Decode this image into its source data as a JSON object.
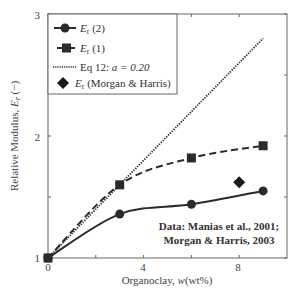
{
  "chart_data": {
    "type": "line",
    "title": "",
    "xlabel": "Organoclay, w(wt%)",
    "ylabel": "Relative Modulus, Er (−)",
    "xlim": [
      0,
      10
    ],
    "ylim": [
      1,
      3
    ],
    "xticks": [
      0,
      2,
      4,
      6,
      8
    ],
    "xtick_labels": [
      "0",
      "",
      "4",
      "",
      "8"
    ],
    "yticks": [
      1,
      1.5,
      2,
      2.5,
      3
    ],
    "ytick_labels": [
      "1",
      "",
      "2",
      "",
      "3"
    ],
    "grid": false,
    "legend_position": "upper left",
    "series": [
      {
        "name": "Er (2)",
        "marker": "circle",
        "line": "solid",
        "x": [
          0,
          3,
          6,
          9
        ],
        "values": [
          1.0,
          1.36,
          1.44,
          1.55
        ]
      },
      {
        "name": "Er (1)",
        "marker": "square",
        "line": "dashed",
        "x": [
          0,
          3,
          6,
          9
        ],
        "values": [
          1.0,
          1.6,
          1.82,
          1.92
        ]
      },
      {
        "name": "Eq 12: a = 0.20",
        "marker": "none",
        "line": "dotted",
        "x": [
          0,
          9
        ],
        "values": [
          1.0,
          2.8
        ]
      },
      {
        "name": "Er (Morgan & Harris)",
        "marker": "diamond",
        "line": "none",
        "x": [
          8
        ],
        "values": [
          1.62
        ]
      }
    ],
    "annotations": [
      "Data: Manias et al., 2001;",
      "Morgan & Harris, 2003"
    ]
  },
  "legend": {
    "items": [
      {
        "main": "E",
        "sub": "r",
        "rest": " (2)"
      },
      {
        "main": "E",
        "sub": "r",
        "rest": " (1)"
      },
      {
        "main": "Eq 12: ",
        "sub": "",
        "rest": "a = 0.20"
      },
      {
        "main": "E",
        "sub": "r",
        "rest": " (Morgan & Harris)"
      }
    ]
  },
  "axes": {
    "x_label_main": "Organoclay, ",
    "x_label_var": "w",
    "x_label_unit": "(wt%)",
    "y_label_main": "Relative Modulus, ",
    "y_label_var": "E",
    "y_label_sub": "r",
    "y_label_unit": " (−)"
  },
  "annotation": {
    "line1": "Data: Manias et al., 2001;",
    "line2": "Morgan & Harris, 2003"
  },
  "colors": {
    "ink": "#2b2b2b",
    "axis": "#555555"
  }
}
